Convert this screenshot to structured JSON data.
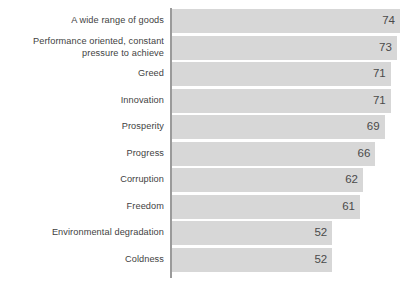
{
  "chart_data": {
    "type": "bar",
    "orientation": "horizontal",
    "title": "",
    "subtitle": "",
    "xlabel": "",
    "ylabel": "",
    "legend": [],
    "grid": false,
    "axis_visible": true,
    "value_labels_shown": true,
    "xlim": [
      0,
      74
    ],
    "categories": [
      "A wide range of goods",
      "Performance oriented, constant\npressure to achieve",
      "Greed",
      "Innovation",
      "Prosperity",
      "Progress",
      "Corruption",
      "Freedom",
      "Environmental degradation",
      "Coldness"
    ],
    "values": [
      74,
      73,
      71,
      71,
      69,
      66,
      62,
      61,
      52,
      52
    ],
    "value_labels": [
      "74",
      "73",
      "71",
      "71",
      "69",
      "66",
      "62",
      "61",
      "52",
      "52"
    ],
    "colors": {
      "bar": "#d7d7d7",
      "axis": "#9a9a9a",
      "label_text": "#3f3f3f",
      "value_text": "#4a4a4a",
      "background": "#ffffff"
    }
  }
}
